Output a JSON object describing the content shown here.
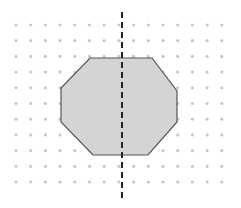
{
  "diagram": {
    "grid": {
      "columns": 15,
      "rows": 11,
      "x0": 16,
      "dx": 14.7,
      "y0": 25,
      "dy": 15.7,
      "dot_radius": 1.6,
      "dot_color": "#c8c8c8"
    },
    "octagon": {
      "points": "90,58 152,58 177,91 177,122 148,155 93,155 61,122 61,88",
      "fill": "#d4d4d4",
      "stroke": "#555555"
    },
    "symmetry_line": {
      "x": 122,
      "y1": 12,
      "y2": 198,
      "color": "#222222",
      "dash": "6,4"
    }
  }
}
